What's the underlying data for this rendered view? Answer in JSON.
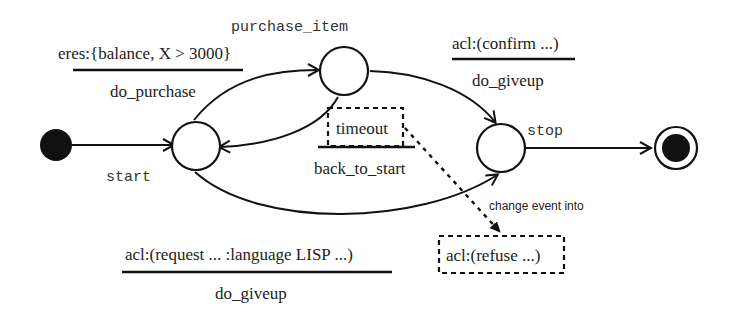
{
  "diagram": {
    "type": "state-machine",
    "states": {
      "purchase_item": "purchase_item",
      "start": "start",
      "stop": "stop"
    },
    "transitions": {
      "to_purchase": {
        "event": "eres:{balance, X > 3000}",
        "action": "do_purchase"
      },
      "purchase_to_stop": {
        "event": "acl:(confirm ...)",
        "action": "do_giveup"
      },
      "purchase_to_start": {
        "event": "timeout",
        "action": "back_to_start"
      },
      "start_to_stop": {
        "event": "acl:(request ... :language LISP ...)",
        "action": "do_giveup"
      }
    },
    "annotation": {
      "label": "change event into",
      "target": "acl:(refuse ...)"
    }
  }
}
